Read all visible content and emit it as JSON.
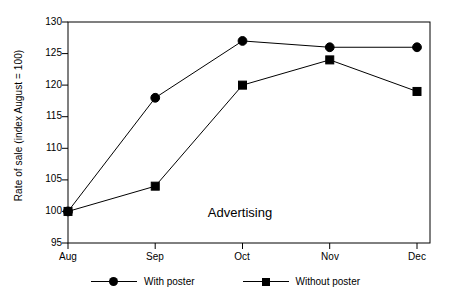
{
  "chart_data": {
    "type": "line",
    "title": "",
    "annotation": "Advertising",
    "xlabel": "",
    "ylabel": "Rate of sale (index August = 100)",
    "categories": [
      "Aug",
      "Sep",
      "Oct",
      "Nov",
      "Dec"
    ],
    "ylim": [
      95,
      130
    ],
    "yticks": [
      95,
      100,
      105,
      110,
      115,
      120,
      125,
      130
    ],
    "ytick_labels": [
      "95",
      "100",
      "105",
      "110",
      "115",
      "120",
      "125",
      "130"
    ],
    "grid": false,
    "legend_position": "bottom",
    "series": [
      {
        "name": "With poster",
        "marker": "circle",
        "color": "#000000",
        "values": [
          100,
          118,
          127,
          126,
          126
        ]
      },
      {
        "name": "Without poster",
        "marker": "square",
        "color": "#000000",
        "values": [
          100,
          104,
          120,
          124,
          119
        ]
      }
    ]
  },
  "legend": {
    "entries": [
      {
        "label": "With poster",
        "marker": "circle"
      },
      {
        "label": "Without poster",
        "marker": "square"
      }
    ]
  },
  "colors": {
    "axis": "#000000",
    "background": "#ffffff",
    "series": "#000000"
  }
}
